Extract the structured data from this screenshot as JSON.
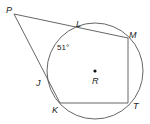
{
  "diagram": {
    "type": "geometry-circle-secants",
    "center": {
      "label": "R",
      "x": 95,
      "y": 71
    },
    "circle_radius": 48,
    "angle_label": "51°",
    "points": {
      "P": {
        "label": "P",
        "x": 14,
        "y": 14
      },
      "L": {
        "label": "L",
        "x": 79,
        "y": 28
      },
      "M": {
        "label": "M",
        "x": 128,
        "y": 38
      },
      "J": {
        "label": "J",
        "x": 48,
        "y": 80
      },
      "K": {
        "label": "K",
        "x": 60,
        "y": 103
      },
      "T": {
        "label": "T",
        "x": 128,
        "y": 103
      }
    },
    "segments": [
      "P-M",
      "P-K",
      "M-T",
      "T-K"
    ],
    "colors": {
      "stroke": "#555555",
      "text": "#222222"
    }
  }
}
